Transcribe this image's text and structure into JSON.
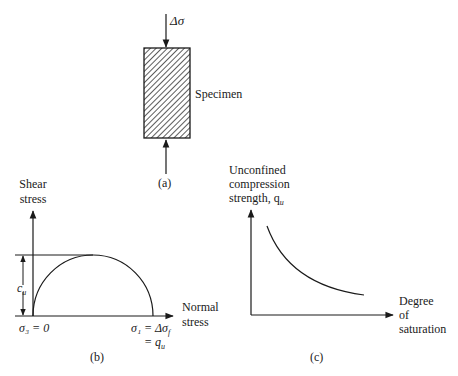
{
  "panel_a": {
    "caption": "(a)",
    "load_top_label": "Δσ",
    "specimen_label": "Specimen"
  },
  "panel_b": {
    "caption": "(b)",
    "y_axis_label_line1": "Shear",
    "y_axis_label_line2": "stress",
    "x_axis_label_line1": "Normal",
    "x_axis_label_line2": "stress",
    "sigma3_label": "σ₃ = 0",
    "sigma1_label_line1": "σ₁ = Δσ",
    "sigma1_subscript": "f",
    "sigma1_label_line2": "= q",
    "sigma1_label_line2_subscript": "u",
    "cu_label": "c",
    "cu_subscript": "u"
  },
  "panel_c": {
    "caption": "(c)",
    "y_axis_label_line1": "Unconfined",
    "y_axis_label_line2": "compression",
    "y_axis_label_line3": "strength, q",
    "y_axis_label_subscript": "u",
    "x_axis_label_line1": "Degree",
    "x_axis_label_line2": "of",
    "x_axis_label_line3": "saturation"
  },
  "colors": {
    "line": "#1a1a1a",
    "hatch": "#333333"
  }
}
